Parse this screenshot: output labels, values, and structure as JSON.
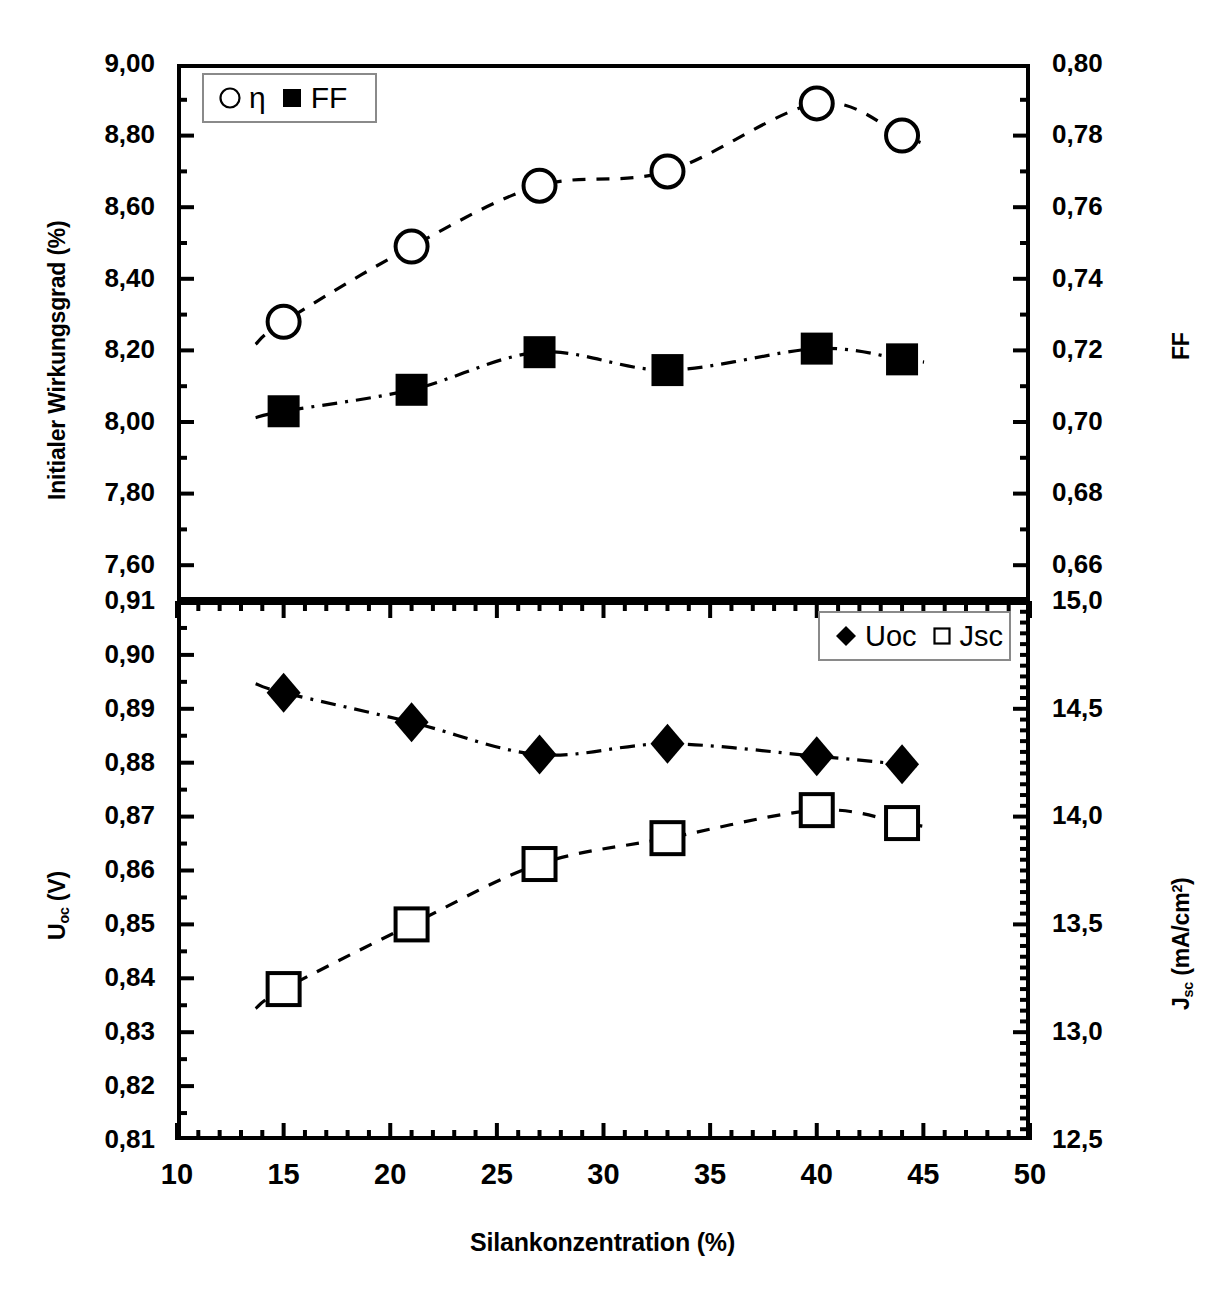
{
  "figure": {
    "xaxis": {
      "label": "Silankonzentration (%)",
      "min": 10,
      "max": 50,
      "major_step": 5,
      "minor_step": 1,
      "ticks": [
        "10",
        "15",
        "20",
        "25",
        "30",
        "35",
        "40",
        "45",
        "50"
      ]
    },
    "top_panel": {
      "left_axis": {
        "label": "Initialer Wirkungsgrad (%)",
        "min": 7.5,
        "max": 9.0,
        "major_step": 0.2,
        "ticks": [
          "9,00",
          "8,80",
          "8,60",
          "8,40",
          "8,20",
          "8,00",
          "7,80",
          "7,60"
        ],
        "tick_values": [
          9.0,
          8.8,
          8.6,
          8.4,
          8.2,
          8.0,
          7.8,
          7.6
        ]
      },
      "right_axis": {
        "label": "FF",
        "min": 0.65,
        "max": 0.8,
        "major_step": 0.02,
        "ticks": [
          "0,80",
          "0,78",
          "0,76",
          "0,74",
          "0,72",
          "0,70",
          "0,68",
          "0,66"
        ],
        "tick_values": [
          0.8,
          0.78,
          0.76,
          0.74,
          0.72,
          0.7,
          0.68,
          0.66
        ]
      },
      "legend": [
        {
          "marker": "open-circle",
          "label": "η"
        },
        {
          "marker": "filled-square",
          "label": "FF"
        }
      ]
    },
    "bottom_panel": {
      "left_axis": {
        "label_main": "U",
        "label_sub": "oc",
        "label_unit": " (V)",
        "min": 0.81,
        "max": 0.91,
        "major_step": 0.01,
        "ticks": [
          "0,91",
          "0,90",
          "0,89",
          "0,88",
          "0,87",
          "0,86",
          "0,85",
          "0,84",
          "0,83",
          "0,82",
          "0,81"
        ],
        "tick_values": [
          0.91,
          0.9,
          0.89,
          0.88,
          0.87,
          0.86,
          0.85,
          0.84,
          0.83,
          0.82,
          0.81
        ]
      },
      "right_axis": {
        "label_main": "J",
        "label_sub": "sc",
        "label_unit": " (mA/cm",
        "label_sup": "2",
        "label_close": ")",
        "min": 12.5,
        "max": 15.0,
        "major_step": 0.5,
        "ticks": [
          "15,0",
          "14,5",
          "14,0",
          "13,5",
          "13,0",
          "12,5"
        ],
        "tick_values": [
          15.0,
          14.5,
          14.0,
          13.5,
          13.0,
          12.5
        ]
      },
      "legend": [
        {
          "marker": "filled-diamond",
          "label": "Uoc"
        },
        {
          "marker": "open-square",
          "label": "Jsc"
        }
      ]
    }
  },
  "chart_data": [
    {
      "type": "scatter",
      "panel": "top",
      "title": "",
      "xlabel": "Silankonzentration (%)",
      "ylabel": "Initialer Wirkungsgrad (%)",
      "y2label": "FF",
      "xlim": [
        10,
        50
      ],
      "ylim": [
        7.5,
        9.0
      ],
      "y2lim": [
        0.65,
        0.8
      ],
      "grid": false,
      "legend_position": "top-left",
      "x": [
        15,
        21,
        27,
        33,
        40,
        44
      ],
      "series": [
        {
          "name": "η",
          "axis": "left",
          "marker": "open-circle",
          "trendline": "dashed",
          "values": [
            8.28,
            8.49,
            8.66,
            8.7,
            8.89,
            8.8
          ]
        },
        {
          "name": "FF",
          "axis": "right",
          "marker": "filled-square",
          "trendline": "dash-dot",
          "values": [
            0.703,
            0.709,
            0.7195,
            0.7145,
            0.7205,
            0.7175
          ]
        }
      ]
    },
    {
      "type": "scatter",
      "panel": "bottom",
      "title": "",
      "xlabel": "Silankonzentration (%)",
      "ylabel": "U_oc (V)",
      "y2label": "J_sc (mA/cm2)",
      "xlim": [
        10,
        50
      ],
      "ylim": [
        0.81,
        0.91
      ],
      "y2lim": [
        12.5,
        15.0
      ],
      "grid": false,
      "legend_position": "top-right",
      "x": [
        15,
        21,
        27,
        33,
        40,
        44
      ],
      "series": [
        {
          "name": "Uoc",
          "axis": "left",
          "marker": "filled-diamond",
          "trendline": "dash-dot",
          "values": [
            0.893,
            0.8875,
            0.8815,
            0.8835,
            0.8812,
            0.8797
          ]
        },
        {
          "name": "Jsc",
          "axis": "right",
          "marker": "open-square",
          "trendline": "dashed",
          "values": [
            13.2,
            13.5,
            13.78,
            13.9,
            14.03,
            13.97
          ]
        }
      ]
    }
  ]
}
